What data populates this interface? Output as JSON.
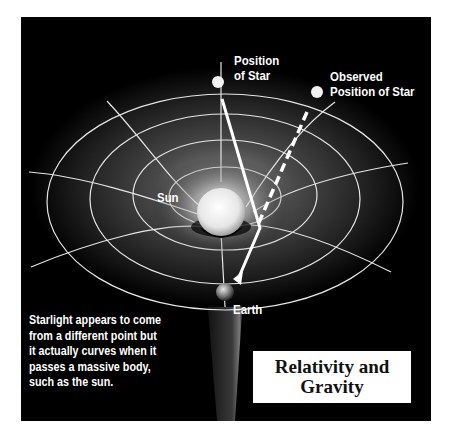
{
  "diagram": {
    "title_line1": "Relativity and",
    "title_line2": "Gravity",
    "labels": {
      "position_of_star_line1": "Position",
      "position_of_star_line2": "of Star",
      "observed_line1": "Observed",
      "observed_line2": "Position of Star",
      "sun": "Sun",
      "earth": "Earth"
    },
    "caption": "Starlight appears to come\nfrom a different point but\nit actually curves when it\npasses a massive body,\nsuch as the sun.",
    "colors": {
      "background": "#000000",
      "grid": "#e6e6e6",
      "text": "#ffffff",
      "title_box": "#ffffff",
      "title_text": "#111111"
    }
  }
}
